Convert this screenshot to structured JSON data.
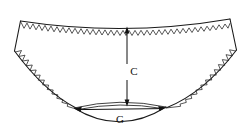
{
  "figure": {
    "background_color": "#ffffff",
    "line_color": "#1a1a1a",
    "width": 250,
    "height": 139
  },
  "annotations": {
    "vertical": {
      "label": "C",
      "description": "Vertical dimension from waistband centre front down to gusset",
      "orientation": "vertical",
      "arrow_style": "double-headed",
      "label_x": 133,
      "label_y": 72,
      "x": 127,
      "y_top": 27,
      "y_bottom": 106
    },
    "horizontal": {
      "label": "G",
      "description": "Horizontal gusset width dimension",
      "orientation": "horizontal",
      "arrow_style": "double-headed",
      "label_x": 120,
      "label_y": 120,
      "y": 108,
      "x_left": 74,
      "x_right": 166
    }
  },
  "garment": {
    "name": "brief-panty",
    "waistband": {
      "name": "waistband-edge",
      "stitch": "zigzag-overlock",
      "path": "M 20.5 21 Q 125 37 230 19",
      "left_corner_x": 20.5,
      "left_corner_y": 21,
      "right_corner_x": 230,
      "right_corner_y": 19
    },
    "side_seam_left": {
      "name": "side-seam-left",
      "path": "M 20.5 21 L 14.5 51"
    },
    "side_seam_right": {
      "name": "side-seam-right",
      "path": "M 230 19 L 236.5 50"
    },
    "leg_opening_left": {
      "name": "leg-opening-left",
      "stitch": "zigzag-overlock",
      "path": "M 14.5 51 Q 45 92 76 108"
    },
    "leg_opening_right": {
      "name": "leg-opening-right",
      "stitch": "zigzag-overlock",
      "path": "M 236.5 50 Q 204 93 166 108"
    },
    "gusset": {
      "name": "gusset-panel",
      "top_path": "M 74 108 Q 120 97 166 107",
      "bottom_path": "M 74 108 Q 120 136 166 107",
      "inner_top_path": "M 77 109 Q 120 100 163 108"
    }
  }
}
